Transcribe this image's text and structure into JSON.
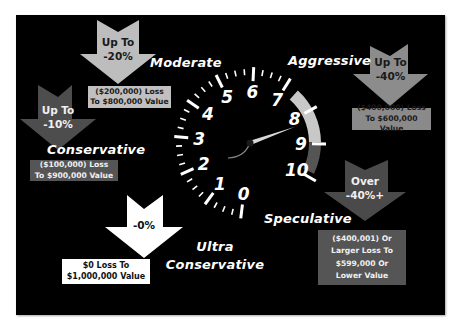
{
  "colors": {
    "panel": "#000000",
    "arrow_moderate": "#bdbdbd",
    "arrow_conservative": "#4d4d4d",
    "arrow_aggressive": "#8c8c8c",
    "arrow_speculative": "#4a4a4a",
    "arrow_ultra": "#ffffff",
    "gauge_band_light": "#c8c8c8",
    "gauge_band_dark": "#555555"
  },
  "gauge": {
    "numbers": [
      "0",
      "1",
      "2",
      "3",
      "4",
      "5",
      "6",
      "7",
      "8",
      "9",
      "10"
    ],
    "needle_value": 8.3,
    "icon": "speedometer-icon"
  },
  "categories": [
    {
      "id": "ultra-conservative",
      "label_line1": "Ultra",
      "label_line2": "Conservative",
      "arrow_line1": "-0%",
      "arrow_line2": "",
      "box_lines": [
        "$0 Loss To",
        "$1,000,000 Value"
      ],
      "icon": "down-arrow-icon"
    },
    {
      "id": "conservative",
      "label": "Conservative",
      "arrow_line1": "Up To",
      "arrow_line2": "-10%",
      "box_lines": [
        "($100,000) Loss",
        "To $900,000 Value"
      ],
      "icon": "down-arrow-icon"
    },
    {
      "id": "moderate",
      "label": "Moderate",
      "arrow_line1": "Up To",
      "arrow_line2": "-20%",
      "box_lines": [
        "($200,000) Loss",
        "To $800,000 Value"
      ],
      "icon": "down-arrow-icon"
    },
    {
      "id": "aggressive",
      "label": "Aggressive",
      "arrow_line1": "Up To",
      "arrow_line2": "-40%",
      "box_lines": [
        "($400,000) Loss",
        "To $600,000 Value"
      ],
      "icon": "down-arrow-icon"
    },
    {
      "id": "speculative",
      "label": "Speculative",
      "arrow_line1": "Over",
      "arrow_line2": "-40%+",
      "box_lines": [
        "($400,001) Or",
        "Larger Loss To",
        "$599,000 Or",
        "Lower Value"
      ],
      "icon": "down-arrow-icon"
    }
  ]
}
